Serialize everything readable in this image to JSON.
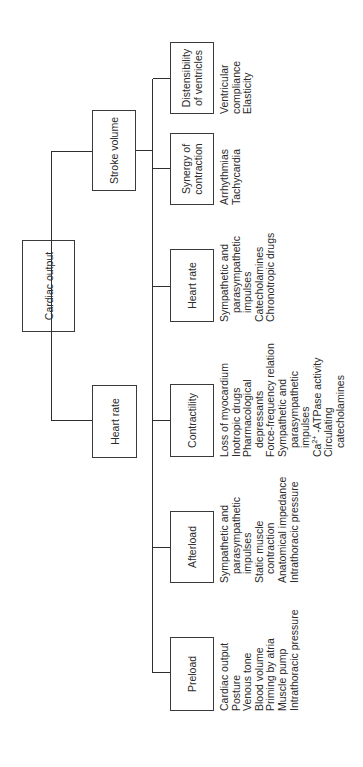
{
  "diagram": {
    "title": "Cardiac output",
    "root": {
      "label": "Cardiac output"
    },
    "level2": [
      {
        "id": "stroke-volume",
        "label": "Stroke volume"
      },
      {
        "id": "heart-rate",
        "label": "Heart rate"
      }
    ],
    "level3": [
      {
        "id": "distensibility",
        "label_lines": [
          "Distensibility",
          "of ventricles"
        ],
        "factors": [
          "Ventricular",
          "compliance",
          "Elasticity"
        ]
      },
      {
        "id": "synergy",
        "label_lines": [
          "Synergy of",
          "contraction"
        ],
        "factors": [
          "Arrhythmias",
          "Tachycardia"
        ]
      },
      {
        "id": "heart-rate",
        "label_lines": [
          "Heart rate"
        ],
        "factors": [
          "Sympathetic and",
          "parasympathetic",
          "impulses",
          "Catecholamines",
          "Chronotropic drugs"
        ]
      },
      {
        "id": "contractility",
        "label_lines": [
          "Contractility"
        ],
        "factors": [
          "Loss of myocardium",
          "Inotropic drugs",
          "Pharmacological",
          "depressants",
          "Force-frequency relation",
          "Sympathetic and",
          "parasympathetic",
          "impulses",
          "Ca2+ -ATPase activity",
          "Circulating",
          "catecholamines"
        ]
      },
      {
        "id": "afterload",
        "label_lines": [
          "Afterload"
        ],
        "factors": [
          "Sympathetic and",
          "parasympathetic",
          "impulses",
          "Static muscle",
          "contraction",
          "Anatomical impedance",
          "Intrathoracic pressure"
        ]
      },
      {
        "id": "preload",
        "label_lines": [
          "Preload"
        ],
        "factors": [
          "Cardiac output",
          "Posture",
          "Venous tone",
          "Blood volume",
          "Priming by atria",
          "Muscle pump",
          "Intrathoracic pressure"
        ]
      }
    ],
    "text": {
      "ca_prefix": "Ca",
      "ca_sup": "2+",
      "ca_suffix": " -ATPase activity"
    },
    "colors": {
      "line": "#2e2e2e",
      "text": "#2a2a2a",
      "background": "#ffffff"
    }
  }
}
